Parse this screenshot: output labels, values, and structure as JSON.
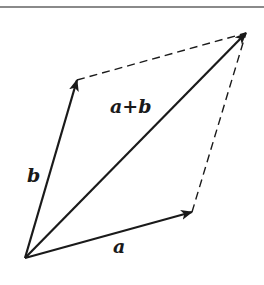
{
  "diagram": {
    "colors": {
      "background": "#ffffff",
      "rule": "#8a8a8a",
      "stroke": "#1a1a1a"
    },
    "top_rule": {
      "y": 7,
      "x1": 0,
      "x2": 264
    },
    "origin": {
      "x": 25,
      "y": 258
    },
    "vectors": [
      {
        "id": "a",
        "label": "a",
        "tip": {
          "x": 192,
          "y": 212
        },
        "label_pos": {
          "x": 113,
          "y": 253
        }
      },
      {
        "id": "b",
        "label": "b",
        "tip": {
          "x": 77,
          "y": 80
        },
        "label_pos": {
          "x": 27,
          "y": 182
        }
      },
      {
        "id": "a_plus_b",
        "label": "a+b",
        "tip": {
          "x": 246,
          "y": 33
        },
        "label_pos": {
          "x": 110,
          "y": 113
        }
      }
    ],
    "dashed_edges": [
      {
        "from": "b_tip",
        "to": "sum_tip"
      },
      {
        "from": "a_tip",
        "to": "sum_tip"
      }
    ]
  }
}
